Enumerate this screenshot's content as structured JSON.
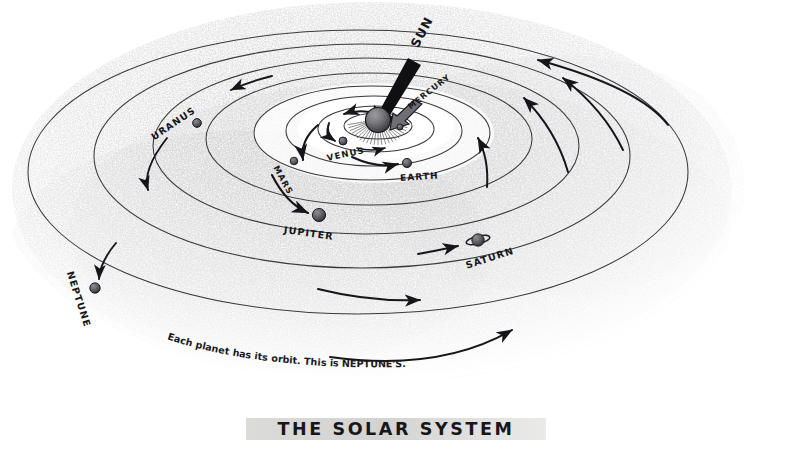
{
  "figure": {
    "title": "THE SOLAR SYSTEM",
    "caption": "Each planet has its orbit. This is NEPTUNE'S.",
    "medium": "pencil drawing",
    "background_color": "#ffffff",
    "ink_color": "#16161a",
    "shading_color": "#b8b8b8"
  },
  "bodies": [
    {
      "id": "sun",
      "label": "SUN",
      "kind": "star",
      "x": 378,
      "y": 120,
      "r": 12.5,
      "label_x": 414,
      "label_y": 46,
      "label_rotate": -62,
      "label_size": 12.5,
      "has_arrow": true,
      "arrow_style": "thick",
      "has_rays": true
    },
    {
      "id": "mercury",
      "label": "MERCURY",
      "kind": "planet",
      "x": 400,
      "y": 127,
      "r": 3.0,
      "label_x": 409,
      "label_y": 108,
      "label_rotate": -38,
      "label_size": 8.0,
      "has_arrow": true,
      "arrow_style": "thick",
      "has_rays": false
    },
    {
      "id": "venus",
      "label": "VENUS",
      "kind": "planet",
      "x": 343,
      "y": 141,
      "r": 4.0,
      "label_x": 327,
      "label_y": 158,
      "label_rotate": -12,
      "label_size": 8.6,
      "has_arrow": true,
      "arrow_style": "thin",
      "has_rays": false
    },
    {
      "id": "earth",
      "label": "EARTH",
      "kind": "planet",
      "x": 407,
      "y": 163,
      "r": 4.6,
      "label_x": 400,
      "label_y": 178,
      "label_rotate": -4,
      "label_size": 9.0,
      "has_arrow": true,
      "arrow_style": "thin",
      "has_rays": false
    },
    {
      "id": "mars",
      "label": "MARS",
      "kind": "planet",
      "x": 294,
      "y": 161,
      "r": 3.8,
      "label_x": 276,
      "label_y": 166,
      "label_rotate": 62,
      "label_size": 8.4,
      "has_arrow": true,
      "arrow_style": "thin",
      "has_rays": false
    },
    {
      "id": "jupiter",
      "label": "JUPITER",
      "kind": "planet",
      "x": 319,
      "y": 215,
      "r": 6.6,
      "label_x": 284,
      "label_y": 230,
      "label_rotate": 8,
      "label_size": 9.6,
      "has_arrow": true,
      "arrow_style": "thin",
      "has_rays": false
    },
    {
      "id": "saturn",
      "label": "SATURN",
      "kind": "planet",
      "x": 478,
      "y": 240,
      "r": 6.2,
      "label_x": 466,
      "label_y": 266,
      "label_rotate": -18,
      "label_size": 9.6,
      "has_arrow": true,
      "arrow_style": "thin",
      "has_rays": false,
      "has_ring": true
    },
    {
      "id": "uranus",
      "label": "URANUS",
      "kind": "planet",
      "x": 197,
      "y": 123,
      "r": 4.4,
      "label_x": 152,
      "label_y": 138,
      "label_rotate": -34,
      "label_size": 9.4,
      "has_arrow": true,
      "arrow_style": "thin",
      "has_rays": false
    },
    {
      "id": "neptune",
      "label": "NEPTUNE",
      "kind": "planet",
      "x": 95,
      "y": 288,
      "r": 5.2,
      "label_x": 70,
      "label_y": 272,
      "label_rotate": 72,
      "label_size": 9.6,
      "has_arrow": true,
      "arrow_style": "thin",
      "has_rays": false
    }
  ],
  "orbits": [
    {
      "id": "orbit-mercury",
      "rx": 34,
      "ry": 13,
      "cx": 378,
      "cy": 126
    },
    {
      "id": "orbit-venus",
      "rx": 58,
      "ry": 23,
      "cx": 376,
      "cy": 129
    },
    {
      "id": "orbit-earth",
      "rx": 88,
      "ry": 35,
      "cx": 374,
      "cy": 131
    },
    {
      "id": "orbit-mars",
      "rx": 118,
      "ry": 47,
      "cx": 372,
      "cy": 133
    },
    {
      "id": "orbit-jupiter",
      "rx": 163,
      "ry": 66,
      "cx": 369,
      "cy": 139
    },
    {
      "id": "orbit-saturn",
      "rx": 213,
      "ry": 88,
      "cx": 366,
      "cy": 146
    },
    {
      "id": "orbit-uranus",
      "rx": 268,
      "ry": 112,
      "cx": 362,
      "cy": 156
    },
    {
      "id": "orbit-neptune",
      "rx": 330,
      "ry": 142,
      "cx": 358,
      "cy": 172
    }
  ],
  "caption_letters": [
    "E",
    "a",
    "c",
    "h",
    " ",
    "p",
    "l",
    "a",
    "n",
    "e",
    "t",
    " ",
    "h",
    "a",
    "s",
    " ",
    "i",
    "t",
    "s",
    " ",
    "o",
    "r",
    "b",
    "i",
    "t",
    ".",
    " ",
    "T",
    "h",
    "i",
    "s",
    " ",
    "i",
    "s",
    " ",
    "N",
    "E",
    "P",
    "T",
    "U",
    "N",
    "E",
    "'",
    "S",
    "."
  ]
}
